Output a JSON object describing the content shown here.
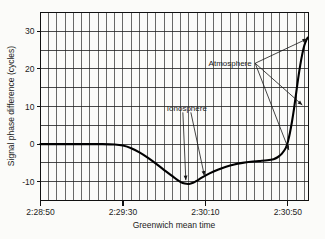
{
  "chart_data": {
    "type": "line",
    "title": "",
    "xlabel": "Greenwich mean time",
    "ylabel": "Signal phase difference (cycles)",
    "ylim": [
      -15,
      35
    ],
    "xlim_labels": [
      "2:28:50",
      "2:30:60"
    ],
    "grid": true,
    "legend": "none",
    "y_ticks": [
      {
        "value": 30,
        "label": "30"
      },
      {
        "value": 20,
        "label": "20"
      },
      {
        "value": 10,
        "label": "10"
      },
      {
        "value": 0,
        "label": "0"
      },
      {
        "value": -10,
        "label": "-10"
      }
    ],
    "y_minor_gridlines": [
      35,
      30,
      25,
      20,
      15,
      10,
      5,
      0,
      -5,
      -10,
      -15
    ],
    "x_ticks": [
      {
        "value": 0,
        "label": "2:28:50"
      },
      {
        "value": 40,
        "label": "2:29:30"
      },
      {
        "value": 80,
        "label": "2:30:10"
      },
      {
        "value": 120,
        "label": "2:30:50"
      }
    ],
    "x_minor_interval_seconds": 4,
    "xlim": [
      0,
      130
    ],
    "series": [
      {
        "name": "Signal phase difference",
        "points": [
          [
            0,
            0.0
          ],
          [
            8,
            0.0
          ],
          [
            16,
            0.0
          ],
          [
            24,
            0.0
          ],
          [
            30,
            0.0
          ],
          [
            36,
            -0.1
          ],
          [
            40,
            -0.4
          ],
          [
            44,
            -1.1
          ],
          [
            48,
            -2.2
          ],
          [
            52,
            -3.6
          ],
          [
            56,
            -5.2
          ],
          [
            60,
            -6.9
          ],
          [
            64,
            -8.5
          ],
          [
            66,
            -9.4
          ],
          [
            68,
            -10.1
          ],
          [
            70,
            -10.5
          ],
          [
            72,
            -10.6
          ],
          [
            74,
            -10.3
          ],
          [
            76,
            -9.7
          ],
          [
            78,
            -9.0
          ],
          [
            82,
            -7.8
          ],
          [
            86,
            -6.8
          ],
          [
            90,
            -6.0
          ],
          [
            94,
            -5.4
          ],
          [
            98,
            -5.0
          ],
          [
            102,
            -4.7
          ],
          [
            106,
            -4.5
          ],
          [
            110,
            -4.3
          ],
          [
            113,
            -4.0
          ],
          [
            115,
            -3.5
          ],
          [
            117,
            -2.6
          ],
          [
            119,
            -1.0
          ],
          [
            120,
            0.6
          ],
          [
            121,
            3.0
          ],
          [
            122,
            6.0
          ],
          [
            123,
            9.5
          ],
          [
            124,
            13.5
          ],
          [
            125,
            17.5
          ],
          [
            126,
            21.0
          ],
          [
            127,
            24.0
          ],
          [
            128,
            26.3
          ],
          [
            129,
            27.7
          ],
          [
            129.6,
            28.3
          ]
        ]
      }
    ],
    "annotations": [
      {
        "label": "Ionosphere",
        "label_x": 71,
        "label_y": 9.5,
        "targets": [
          {
            "x": 70.5,
            "y": -9.6
          },
          {
            "x": 79.5,
            "y": -8.4
          }
        ]
      },
      {
        "label": "Atmosphere",
        "label_x": 92,
        "label_y": 21.5,
        "targets": [
          {
            "x": 129.3,
            "y": 28.0
          },
          {
            "x": 127.0,
            "y": 10.4
          },
          {
            "x": 120.5,
            "y": -1.6
          }
        ]
      }
    ]
  },
  "colors": {
    "curve": "#000000",
    "grid": "#2a2a2a",
    "frame": "#101010",
    "text": "#1b1b1b",
    "background": "#fbfbf9"
  }
}
